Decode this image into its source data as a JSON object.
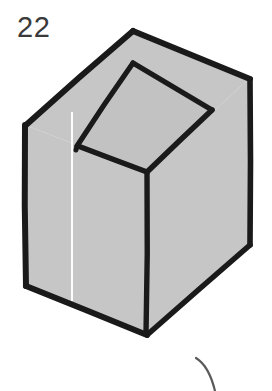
{
  "figure": {
    "number_label": "22",
    "caption": "",
    "object_name": "open-topped rectangular box drawn in oblique projection",
    "style": "hand-drawn line art with flat gray fill"
  },
  "colors": {
    "background": "#ffffff",
    "fill_gray": "#c6c6c6",
    "fill_gray_interior": "#c2c2c2",
    "stroke_black": "#1a1a1a",
    "highlight_white": "#fdfdfd",
    "label_text": "#3a3a3a",
    "stray_mark": "#4a4a4a"
  },
  "geometry": {
    "outer_outline": "25,125 133,30 250,78 250,245 146,335 25,285",
    "front_left_face": "25,125 147,172 146,335 25,285",
    "front_right_face": "147,172 250,78 250,245 146,335",
    "top_rim_outer": "25,125 133,30 250,78 147,172",
    "inner_opening": "77,145 133,62 212,110 147,172",
    "white_highlight_line": "72,113 72,300",
    "vertices": {
      "top_apex": [
        133,
        30
      ],
      "right_top": [
        250,
        78
      ],
      "left_top": [
        25,
        125
      ],
      "front_top": [
        147,
        172
      ],
      "left_bottom": [
        25,
        285
      ],
      "front_bottom": [
        146,
        335
      ],
      "right_bottom": [
        250,
        245
      ],
      "inner_left": [
        77,
        145
      ],
      "inner_back": [
        133,
        62
      ],
      "inner_right": [
        212,
        110
      ]
    }
  },
  "stray_mark": {
    "name": "partial curved stroke from neighboring figure",
    "path": "M 196,358 Q 209,366 215,391"
  }
}
